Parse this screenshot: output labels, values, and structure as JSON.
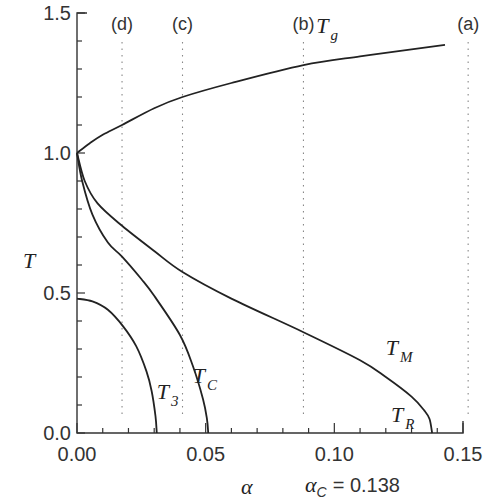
{
  "chart_data": {
    "type": "line",
    "title": "",
    "xlabel": "α",
    "ylabel": "T",
    "xlim": [
      0.0,
      0.15
    ],
    "ylim": [
      0.0,
      1.5
    ],
    "grid": false,
    "x_ticks": [
      "0.00",
      "0.05",
      "0.10",
      "0.15"
    ],
    "y_ticks": [
      "0.0",
      "0.5",
      "1.0",
      "1.5"
    ],
    "annotation": {
      "text": "α",
      "sub": "C",
      "value": "= 0.138"
    },
    "vertical_markers": [
      {
        "label": "(a)",
        "x": 0.152
      },
      {
        "label": "(b)",
        "x": 0.088
      },
      {
        "label": "(c)",
        "x": 0.041
      },
      {
        "label": "(d)",
        "x": 0.0175
      }
    ],
    "series": [
      {
        "name": "T_g",
        "label": "T",
        "sub": "g",
        "x": [
          0.0,
          0.005,
          0.01,
          0.0175,
          0.03,
          0.041,
          0.06,
          0.088,
          0.11,
          0.13,
          0.143
        ],
        "y": [
          1.0,
          1.035,
          1.065,
          1.1,
          1.16,
          1.2,
          1.25,
          1.314,
          1.345,
          1.37,
          1.386
        ]
      },
      {
        "name": "T_M",
        "label": "T",
        "sub": "M",
        "x": [
          0.0,
          0.003,
          0.008,
          0.0175,
          0.03,
          0.041,
          0.06,
          0.088,
          0.11,
          0.12,
          0.13,
          0.135,
          0.137,
          0.138
        ],
        "y": [
          1.0,
          0.9,
          0.82,
          0.74,
          0.65,
          0.575,
          0.48,
          0.36,
          0.26,
          0.2,
          0.13,
          0.08,
          0.05,
          0.0
        ]
      },
      {
        "name": "T_C",
        "label": "T",
        "sub": "C",
        "x": [
          0.0,
          0.002,
          0.006,
          0.012,
          0.0175,
          0.025,
          0.03,
          0.04,
          0.045,
          0.049,
          0.0505,
          0.051
        ],
        "y": [
          1.0,
          0.9,
          0.78,
          0.68,
          0.63,
          0.55,
          0.49,
          0.35,
          0.24,
          0.12,
          0.05,
          0.0
        ]
      },
      {
        "name": "T_3",
        "label": "T",
        "sub": "3",
        "x": [
          0.0,
          0.006,
          0.012,
          0.018,
          0.023,
          0.027,
          0.029,
          0.0305,
          0.031
        ],
        "y": [
          0.48,
          0.47,
          0.44,
          0.38,
          0.31,
          0.22,
          0.15,
          0.06,
          0.0
        ]
      }
    ],
    "curve_label_positions": [
      {
        "series": "T_g",
        "x": 0.093,
        "y": 1.43
      },
      {
        "series": "T_M",
        "x": 0.12,
        "y": 0.28
      },
      {
        "series": "T_C",
        "x": 0.045,
        "y": 0.18
      },
      {
        "series": "T_3",
        "x": 0.031,
        "y": 0.12
      },
      {
        "series": "T_R",
        "label": "T",
        "sub": "R",
        "x": 0.122,
        "y": 0.04
      }
    ]
  }
}
